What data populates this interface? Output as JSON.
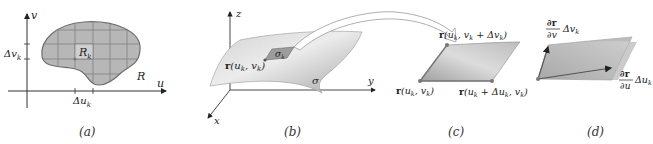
{
  "panels": [
    {
      "id": "a",
      "caption": "(a)",
      "axis_labels": {
        "vertical": "v",
        "horizontal": "u"
      },
      "region_label": "R",
      "subregion_label": "R",
      "subregion_subscript": "k",
      "delta_v_label": "Δv",
      "delta_v_subscript": "k",
      "delta_u_label": "Δu",
      "delta_u_subscript": "k"
    },
    {
      "id": "b",
      "caption": "(b)",
      "axis_labels": {
        "z": "z",
        "y": "y",
        "x": "x"
      },
      "surface_label": "σ",
      "patch_label": "σ",
      "patch_subscript": "k",
      "point_label": "r(u",
      "point_label_full": "r(u_k, v_k)"
    },
    {
      "id": "c",
      "caption": "(c)",
      "top_label": "r(u_k, v_k + Δv_k)",
      "bottom_left_label": "r(u_k, v_k)",
      "bottom_right_label": "r(u_k + Δu_k, v_k)"
    },
    {
      "id": "d",
      "caption": "(d)",
      "partial_v_num": "∂r",
      "partial_v_den": "∂v",
      "partial_v_factor": "Δv",
      "partial_v_sub": "k",
      "partial_u_num": "∂r",
      "partial_u_den": "∂u",
      "partial_u_factor": "Δu",
      "partial_u_sub": "k"
    }
  ],
  "colors": {
    "region_fill": "#b4b4b4",
    "region_stroke": "#6e6e6e",
    "surface_light": "#e6e6e6",
    "surface_dark": "#a9a9a9",
    "axis": "#333333"
  }
}
